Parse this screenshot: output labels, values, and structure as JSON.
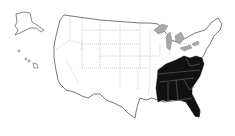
{
  "map": {
    "title": "United States map with highlighted Southeastern states",
    "colors": {
      "background": "#ffffff",
      "land": "#ffffff",
      "outline": "#555555",
      "state_border": "#9a9a9a",
      "highlight": "#111111",
      "lakes": "#a8a8a8"
    },
    "highlighted_states": [
      "Kentucky",
      "Tennessee",
      "West Virginia",
      "Virginia",
      "North Carolina",
      "South Carolina",
      "Georgia",
      "Alabama",
      "Mississippi",
      "Florida"
    ],
    "insets": [
      "Alaska",
      "Hawaii"
    ]
  }
}
